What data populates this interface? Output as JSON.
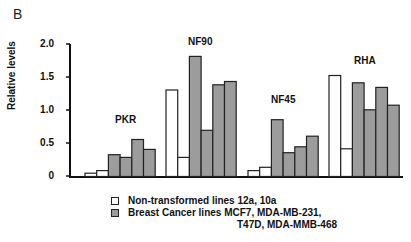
{
  "panel_label": "B",
  "chart_data": {
    "type": "bar",
    "title": "",
    "xlabel": "",
    "ylabel": "Relative levels",
    "ylim": [
      0,
      2.0
    ],
    "yticks": [
      0,
      0.5,
      1.0,
      1.5,
      2.0
    ],
    "ytick_labels": [
      "0",
      "0.5",
      "1.0",
      "1.5",
      "2.0"
    ],
    "grid": false,
    "legend_position": "bottom-center",
    "categories": [
      "PKR",
      "NF90",
      "NF45",
      "RHA"
    ],
    "bar_series": [
      {
        "name": "12a",
        "group": "Non-transformed",
        "values": [
          0.05,
          1.31,
          0.09,
          1.53
        ]
      },
      {
        "name": "10a",
        "group": "Non-transformed",
        "values": [
          0.09,
          0.29,
          0.14,
          0.42
        ]
      },
      {
        "name": "MCF7",
        "group": "Breast Cancer",
        "values": [
          0.33,
          1.82,
          0.86,
          1.42
        ]
      },
      {
        "name": "MDA-MB-231",
        "group": "Breast Cancer",
        "values": [
          0.29,
          0.7,
          0.36,
          1.01
        ]
      },
      {
        "name": "T47D",
        "group": "Breast Cancer",
        "values": [
          0.56,
          1.39,
          0.45,
          1.35
        ]
      },
      {
        "name": "MDA-MMB-468",
        "group": "Breast Cancer",
        "values": [
          0.41,
          1.44,
          0.61,
          1.08
        ]
      }
    ],
    "legend": [
      {
        "label": "Non-transformed lines 12a, 10a",
        "color": "#ffffff"
      },
      {
        "label": "Breast Cancer lines MCF7, MDA-MB-231,",
        "label_cont": "T47D, MDA-MMB-468",
        "color": "#9c9c9c"
      }
    ],
    "colors": {
      "non_transformed": "#ffffff",
      "breast_cancer": "#9c9c9c",
      "outline": "#222222"
    }
  }
}
